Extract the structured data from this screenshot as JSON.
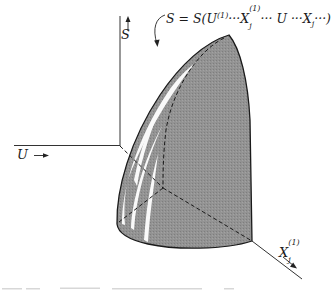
{
  "figure": {
    "axes": {
      "s_axis": {
        "label": "S",
        "arrow": "up"
      },
      "u_axis": {
        "label": "U",
        "arrow": "right"
      },
      "x_axis": {
        "label": "X",
        "subscript": "j",
        "superscript": "(1)",
        "arrow": "down-right"
      }
    },
    "surface_equation": {
      "lhs": "S = S(U",
      "parts": [
        {
          "text": "S = S(U"
        },
        {
          "sup": "(1)"
        },
        {
          "text": "···X"
        },
        {
          "sup": "(1)",
          "sub": "j"
        },
        {
          "text": "··· U ···X"
        },
        {
          "sub": "j"
        },
        {
          "text": "···)"
        }
      ]
    },
    "colors": {
      "surface_fill": "#8f8f8f",
      "highlight": "#ffffff",
      "line": "#1a1a1a",
      "background": "#ffffff"
    }
  }
}
